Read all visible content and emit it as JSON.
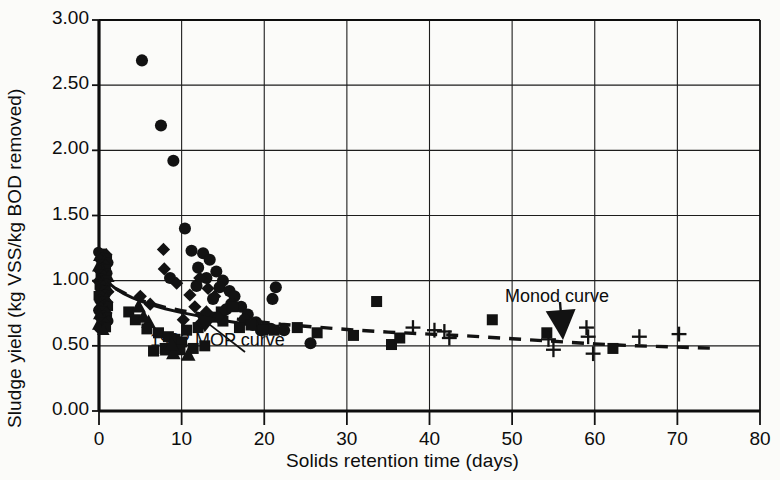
{
  "chart_data": {
    "type": "scatter",
    "title": "",
    "xlabel": "Solids retention time (days)",
    "ylabel": "Sludge yield (kg VSS/kg BOD removed)",
    "xlim": [
      0,
      80
    ],
    "ylim": [
      0.0,
      3.0
    ],
    "xticks": [
      "0",
      "10",
      "20",
      "30",
      "40",
      "50",
      "60",
      "70",
      "80"
    ],
    "yticks": [
      "0.00",
      "0.50",
      "1.00",
      "1.50",
      "2.00",
      "2.50",
      "3.00"
    ],
    "grid": true,
    "legend": "none",
    "annotations": [
      {
        "name": "mop-curve-label",
        "text": "1992 MOP curve",
        "x": 5.5,
        "y": 0.47
      },
      {
        "name": "monod-curve-label",
        "text": "Monod curve",
        "x": 48.0,
        "y": 0.84
      }
    ],
    "series": [
      {
        "name": "circle-markers",
        "marker": "circle",
        "color": "#121212",
        "points": [
          [
            5.2,
            2.69
          ],
          [
            7.5,
            2.19
          ],
          [
            9.0,
            1.92
          ],
          [
            10.4,
            1.4
          ],
          [
            11.2,
            1.23
          ],
          [
            12.6,
            1.21
          ],
          [
            13.4,
            1.16
          ],
          [
            12.0,
            1.1
          ],
          [
            14.2,
            1.07
          ],
          [
            13.0,
            1.02
          ],
          [
            15.0,
            1.0
          ],
          [
            14.6,
            0.95
          ],
          [
            15.8,
            0.92
          ],
          [
            16.4,
            0.88
          ],
          [
            13.8,
            0.86
          ],
          [
            16.0,
            0.82
          ],
          [
            17.2,
            0.8
          ],
          [
            15.4,
            0.78
          ],
          [
            18.0,
            0.74
          ],
          [
            17.6,
            0.7
          ],
          [
            19.0,
            0.68
          ],
          [
            18.6,
            0.66
          ],
          [
            20.2,
            0.64
          ],
          [
            20.8,
            0.63
          ],
          [
            19.6,
            0.62
          ],
          [
            21.4,
            0.95
          ],
          [
            21.0,
            0.86
          ],
          [
            22.4,
            0.62
          ],
          [
            25.6,
            0.52
          ],
          [
            8.6,
            1.02
          ],
          [
            11.8,
            0.96
          ]
        ]
      },
      {
        "name": "square-markers",
        "marker": "square",
        "color": "#121212",
        "points": [
          [
            5.8,
            0.63
          ],
          [
            7.2,
            0.6
          ],
          [
            8.4,
            0.57
          ],
          [
            9.2,
            0.55
          ],
          [
            10.0,
            0.53
          ],
          [
            8.0,
            0.48
          ],
          [
            6.6,
            0.46
          ],
          [
            9.8,
            0.47
          ],
          [
            11.4,
            0.48
          ],
          [
            12.8,
            0.5
          ],
          [
            10.6,
            0.62
          ],
          [
            12.0,
            0.64
          ],
          [
            13.6,
            0.72
          ],
          [
            14.8,
            0.76
          ],
          [
            16.2,
            0.8
          ],
          [
            15.0,
            0.69
          ],
          [
            17.0,
            0.64
          ],
          [
            18.4,
            0.66
          ],
          [
            19.8,
            0.62
          ],
          [
            21.2,
            0.62
          ],
          [
            24.0,
            0.64
          ],
          [
            26.4,
            0.6
          ],
          [
            30.8,
            0.58
          ],
          [
            33.6,
            0.84
          ],
          [
            35.4,
            0.51
          ],
          [
            36.4,
            0.56
          ],
          [
            47.6,
            0.7
          ],
          [
            54.2,
            0.6
          ],
          [
            62.2,
            0.48
          ],
          [
            3.6,
            0.76
          ],
          [
            4.4,
            0.7
          ]
        ]
      },
      {
        "name": "diamond-markers",
        "marker": "diamond",
        "color": "#121212",
        "points": [
          [
            7.8,
            1.24
          ],
          [
            7.9,
            1.09
          ],
          [
            9.4,
            0.98
          ],
          [
            11.0,
            0.89
          ],
          [
            12.2,
            1.02
          ],
          [
            13.2,
            0.94
          ],
          [
            14.0,
            0.88
          ],
          [
            11.6,
            0.8
          ],
          [
            6.2,
            0.82
          ],
          [
            5.0,
            0.88
          ],
          [
            13.0,
            0.76
          ],
          [
            14.4,
            0.72
          ],
          [
            10.2,
            0.7
          ],
          [
            12.4,
            0.68
          ]
        ]
      },
      {
        "name": "triangle-markers",
        "marker": "triangle",
        "color": "#121212",
        "points": [
          [
            8.2,
            0.47
          ],
          [
            9.0,
            0.44
          ],
          [
            10.8,
            0.43
          ],
          [
            8.8,
            0.51
          ],
          [
            6.0,
            0.68
          ],
          [
            5.4,
            0.72
          ],
          [
            4.8,
            0.8
          ]
        ]
      },
      {
        "name": "plus-markers",
        "marker": "plus",
        "color": "#121212",
        "points": [
          [
            38.0,
            0.64
          ],
          [
            40.6,
            0.62
          ],
          [
            41.8,
            0.61
          ],
          [
            42.4,
            0.56
          ],
          [
            54.4,
            0.55
          ],
          [
            55.0,
            0.47
          ],
          [
            59.0,
            0.64
          ],
          [
            59.2,
            0.57
          ],
          [
            59.8,
            0.44
          ],
          [
            65.4,
            0.57
          ],
          [
            70.2,
            0.59
          ]
        ]
      },
      {
        "name": "dense-axis-cluster",
        "marker": "dense",
        "color": "#121212",
        "note": "near-vertical dense band of points at short SRT",
        "x": 0.4,
        "y_range": [
          0.62,
          1.22
        ],
        "count": 60
      }
    ],
    "curves": [
      {
        "name": "1992-MOP-curve",
        "style": "solid",
        "color": "#121212",
        "points": [
          [
            0.0,
            1.06
          ],
          [
            1.0,
            0.99
          ],
          [
            2.0,
            0.94
          ],
          [
            3.0,
            0.9
          ],
          [
            4.0,
            0.87
          ],
          [
            5.0,
            0.845
          ],
          [
            6.0,
            0.82
          ],
          [
            8.0,
            0.785
          ],
          [
            10.0,
            0.755
          ],
          [
            12.0,
            0.73
          ],
          [
            14.0,
            0.705
          ],
          [
            16.0,
            0.685
          ],
          [
            18.0,
            0.665
          ],
          [
            20.0,
            0.65
          ],
          [
            22.0,
            0.635
          ]
        ]
      },
      {
        "name": "monod-curve",
        "style": "dashed",
        "color": "#121212",
        "points": [
          [
            2.0,
            0.94
          ],
          [
            4.0,
            0.875
          ],
          [
            6.0,
            0.83
          ],
          [
            8.0,
            0.795
          ],
          [
            10.0,
            0.77
          ],
          [
            14.0,
            0.725
          ],
          [
            18.0,
            0.695
          ],
          [
            22.0,
            0.665
          ],
          [
            26.0,
            0.645
          ],
          [
            30.0,
            0.625
          ],
          [
            35.0,
            0.605
          ],
          [
            40.0,
            0.59
          ],
          [
            45.0,
            0.575
          ],
          [
            50.0,
            0.555
          ],
          [
            55.0,
            0.535
          ],
          [
            60.0,
            0.515
          ],
          [
            65.0,
            0.5
          ],
          [
            70.0,
            0.49
          ],
          [
            75.0,
            0.48
          ]
        ]
      }
    ],
    "arrows": [
      {
        "name": "mop-curve-arrow",
        "from": [
          5.6,
          0.56
        ],
        "to": [
          4.2,
          0.72
        ]
      },
      {
        "name": "monod-curve-arrow",
        "from": [
          51.0,
          0.78
        ],
        "to": [
          52.6,
          0.6
        ]
      }
    ]
  }
}
